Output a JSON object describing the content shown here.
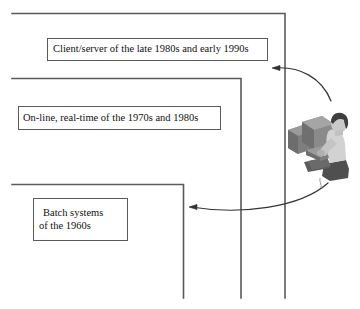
{
  "diagram": {
    "colors": {
      "line": "#5a5a5a",
      "box_border": "#5a5a5a",
      "arrow": "#333333",
      "background": "#ffffff",
      "clipart_mid_gray": "#8a8a8a",
      "clipart_dark_gray": "#555555",
      "clipart_light_gray": "#c8c8c8"
    },
    "boxes": [
      {
        "name": "client-server",
        "lines": [
          "Client/server of the late 1980s and early 1990s"
        ]
      },
      {
        "name": "online-realtime",
        "lines": [
          "On-line, real-time of the 1970s and 1980s"
        ]
      },
      {
        "name": "batch-systems",
        "lines": [
          "Batch systems",
          "of the 1960s"
        ]
      }
    ],
    "clipart": {
      "name": "person-at-computer",
      "description": "person seated at a desktop computer"
    },
    "arrows": [
      {
        "name": "arrow-to-client-server",
        "direction": "left"
      },
      {
        "name": "arrow-to-batch-systems",
        "direction": "left"
      }
    ]
  }
}
